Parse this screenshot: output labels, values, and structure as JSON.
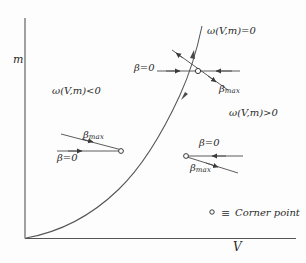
{
  "figure": {
    "kind": "phase-diagram",
    "background_color": "#fdfdfd",
    "ink_color": "#3a3a3a",
    "axes": {
      "y_label": "m",
      "x_label": "V"
    },
    "curve_label": "ω(V,m)=0",
    "regions": [
      {
        "name": "left-region",
        "label": "ω(V,m)<0"
      },
      {
        "name": "right-region",
        "label": "ω(V,m)>0"
      }
    ],
    "annotations": {
      "top_beta_zero": {
        "symbol": "β",
        "equals": "=",
        "value": "0"
      },
      "top_beta_max": {
        "symbol": "β",
        "subscript": "max"
      },
      "left_beta_max": {
        "symbol": "β",
        "subscript": "max"
      },
      "left_beta_zero": {
        "symbol": "β",
        "equals": "=",
        "value": "0"
      },
      "right_beta_zero": {
        "symbol": "β",
        "equals": "=",
        "value": "0"
      },
      "right_beta_max": {
        "symbol": "β",
        "subscript": "max"
      }
    },
    "legend": {
      "marker": "∘",
      "equiv": "≡",
      "text": "Corner point"
    }
  }
}
